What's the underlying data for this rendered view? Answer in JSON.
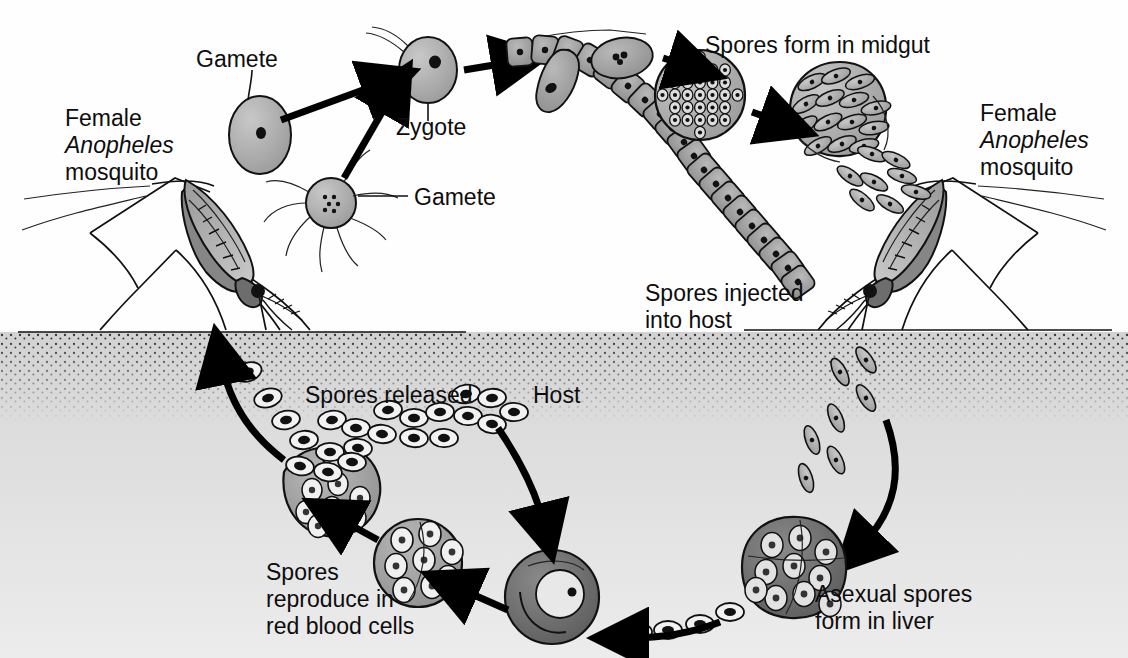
{
  "figure": {
    "domain": "biology-diagram",
    "background_color": "#fefefe",
    "ink_color": "#111111",
    "host_tissue_color": "#d9d9d9"
  },
  "labels": {
    "mosquito_left_line1": "Female",
    "mosquito_left_line2": "Anopheles",
    "mosquito_left_line3": "mosquito",
    "mosquito_right_line1": "Female",
    "mosquito_right_line2": "Anopheles",
    "mosquito_right_line3": "mosquito",
    "gamete_top": "Gamete",
    "gamete_bottom": "Gamete",
    "zygote": "Zygote",
    "spores_form_midgut": "Spores form in midgut",
    "spores_injected_line1": "Spores injected",
    "spores_injected_line2": "into host",
    "spores_released": "Spores released",
    "host": "Host",
    "spores_reproduce_line1": "Spores",
    "spores_reproduce_line2": "reproduce in",
    "spores_reproduce_line3": "red blood cells",
    "asexual_line1": "Asexual spores",
    "asexual_line2": "form in liver"
  },
  "structures": {
    "macrogamete": "oval cell with single nucleus",
    "microgamete": "round cell with eight flagella",
    "zygote": "oval cell with nucleus and short tail",
    "ookinete": "elongated cell penetrating midgut wall",
    "midgut_epithelium": "chain of cuboidal gray cells",
    "oocyst_developing": "round cyst packed with rounded spores",
    "oocyst_ruptured": "cyst bursting with spindle sporozoites",
    "infected_red_blood_cell": "dark cell with ring-stage parasite",
    "schizont": "cell containing many merozoites",
    "bursting_red_blood_cell": "ruptured cell releasing merozoites",
    "liver_cell": "large mottled cell full of asexual spores",
    "skin_surface": "stippled horizontal boundary line"
  }
}
